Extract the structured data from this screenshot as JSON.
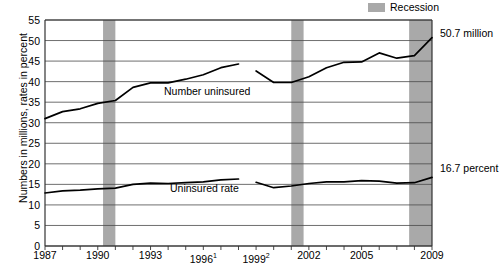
{
  "legend": {
    "swatch_name": "recession-swatch",
    "label": "Recession",
    "color": "#a9a9a9"
  },
  "axes": {
    "ylabel": "Numbers in millions, rates in percent",
    "yticks": [
      "0",
      "5",
      "10",
      "15",
      "20",
      "25",
      "30",
      "35",
      "40",
      "45",
      "50",
      "55"
    ],
    "xticks": [
      {
        "label": "1987",
        "sup": ""
      },
      {
        "label": "1990",
        "sup": ""
      },
      {
        "label": "1993",
        "sup": ""
      },
      {
        "label": "1996",
        "sup": "1"
      },
      {
        "label": "1999",
        "sup": "2"
      },
      {
        "label": "2002",
        "sup": ""
      },
      {
        "label": "2005",
        "sup": ""
      },
      {
        "label": "2009",
        "sup": ""
      }
    ]
  },
  "annotations": {
    "number_end": "50.7 million",
    "rate_end": "16.7 percent",
    "number_series": "Number uninsured",
    "rate_series": "Uninsured rate"
  },
  "chart_data": {
    "type": "line",
    "title": "",
    "xlabel": "",
    "ylabel": "Numbers in millions, rates in percent",
    "ylim": [
      0,
      55
    ],
    "xlim": [
      1987,
      2009
    ],
    "grid": true,
    "legend_position": "top-right",
    "x": [
      1987,
      1988,
      1989,
      1990,
      1991,
      1992,
      1993,
      1994,
      1995,
      1996,
      1997,
      1998,
      1999,
      2000,
      2001,
      2002,
      2003,
      2004,
      2005,
      2006,
      2007,
      2008,
      2009
    ],
    "series": [
      {
        "name": "Number uninsured",
        "unit": "millions",
        "break_after_x": 1998,
        "values": [
          31.0,
          32.7,
          33.4,
          34.7,
          35.4,
          38.6,
          39.7,
          39.7,
          40.6,
          41.7,
          43.4,
          44.3,
          42.6,
          39.8,
          39.8,
          41.2,
          43.4,
          44.7,
          44.8,
          47.0,
          45.7,
          46.3,
          50.7
        ],
        "values_note": "1999-2009 segment drawn separately after series break"
      },
      {
        "name": "Uninsured rate",
        "unit": "percent",
        "break_after_x": 1998,
        "values": [
          12.9,
          13.4,
          13.6,
          13.9,
          14.1,
          15.0,
          15.3,
          15.2,
          15.4,
          15.6,
          16.1,
          16.3,
          15.5,
          14.2,
          14.6,
          15.2,
          15.6,
          15.6,
          15.9,
          15.8,
          15.3,
          15.4,
          16.7
        ]
      }
    ],
    "recession_bands": [
      {
        "start": 1990.3,
        "end": 1991.0
      },
      {
        "start": 2001.0,
        "end": 2001.7
      },
      {
        "start": 2007.7,
        "end": 2009.0
      }
    ],
    "end_annotations": [
      {
        "series": "Number uninsured",
        "value": 50.7,
        "text": "50.7 million"
      },
      {
        "series": "Uninsured rate",
        "value": 16.7,
        "text": "16.7 percent"
      }
    ]
  }
}
